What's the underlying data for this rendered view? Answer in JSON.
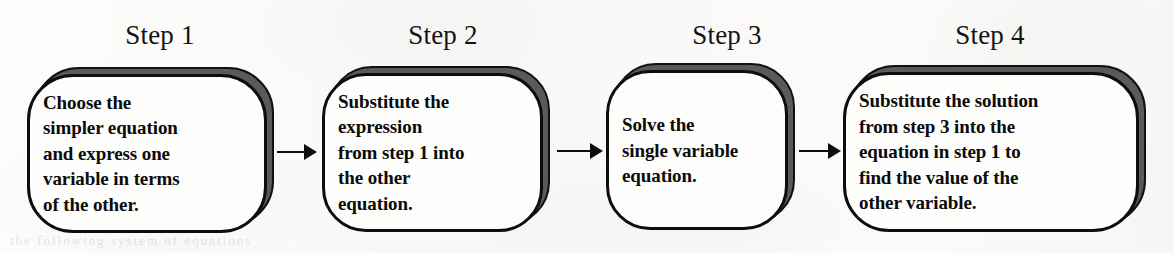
{
  "diagram": {
    "title_prefix": "Step",
    "orientation": "left-to-right",
    "background_color": "#fbfbfa",
    "outline_color": "#0d0d0d",
    "shadow_color": "#5a5a5a",
    "fill_color": "#fdfdfc",
    "steps": [
      {
        "title": "Step 1",
        "text": "Choose the simpler equation and express one variable in terms of the other.",
        "lines": [
          "Choose the",
          "simpler equation",
          "and express one",
          "variable in terms",
          "of the other."
        ]
      },
      {
        "title": "Step 2",
        "text": "Substitute the expression from step 1 into the other equation.",
        "lines": [
          "Substitute the",
          "expression",
          "from step 1 into",
          "the other",
          "equation."
        ]
      },
      {
        "title": "Step 3",
        "text": "Solve the single variable equation.",
        "lines": [
          "Solve the",
          "single variable",
          "equation."
        ]
      },
      {
        "title": "Step 4",
        "text": "Substitute the solution from step 3 into the equation in step 1 to find the value of the other variable.",
        "lines": [
          "Substitute the solution",
          "from step 3 into the",
          "equation in step 1 to",
          "find the value of the",
          "other variable."
        ]
      }
    ],
    "connectors": [
      {
        "name": "arrow-step-1-to-2",
        "from": "Step 1",
        "to": "Step 2"
      },
      {
        "name": "arrow-step-2-to-3",
        "from": "Step 2",
        "to": "Step 3"
      },
      {
        "name": "arrow-step-3-to-4",
        "from": "Step 3",
        "to": "Step 4"
      }
    ]
  },
  "artifacts": {
    "bleed_through_text": "the following system of equations"
  }
}
